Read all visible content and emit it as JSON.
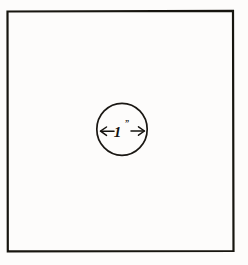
{
  "figure": {
    "background_color": "#fdfcfb",
    "ink_color": "#15130f",
    "canvas": {
      "width": 248,
      "height": 265
    }
  },
  "shapes": {
    "square": {
      "name": "outer square plate",
      "x": 7,
      "y": 11,
      "width": 226,
      "height": 240,
      "stroke_color": "#17150f",
      "stroke_width": 2.2,
      "fill": "none"
    },
    "circle": {
      "name": "center circular hole",
      "cx": 122,
      "cy": 129,
      "r": 25.5,
      "stroke_color": "#1a1713",
      "stroke_width": 1.6,
      "fill": "none"
    }
  },
  "dimension": {
    "name": "diameter dimension",
    "label": "1",
    "unit_mark": "”",
    "full_label": "1”",
    "orientation": "horizontal",
    "line_y": 131,
    "x_start": 100,
    "x_end": 145,
    "stroke_color": "#15130f",
    "stroke_width": 1.5,
    "arrowhead": "open-v-both-ends",
    "label_x": 122,
    "label_y": 136
  }
}
